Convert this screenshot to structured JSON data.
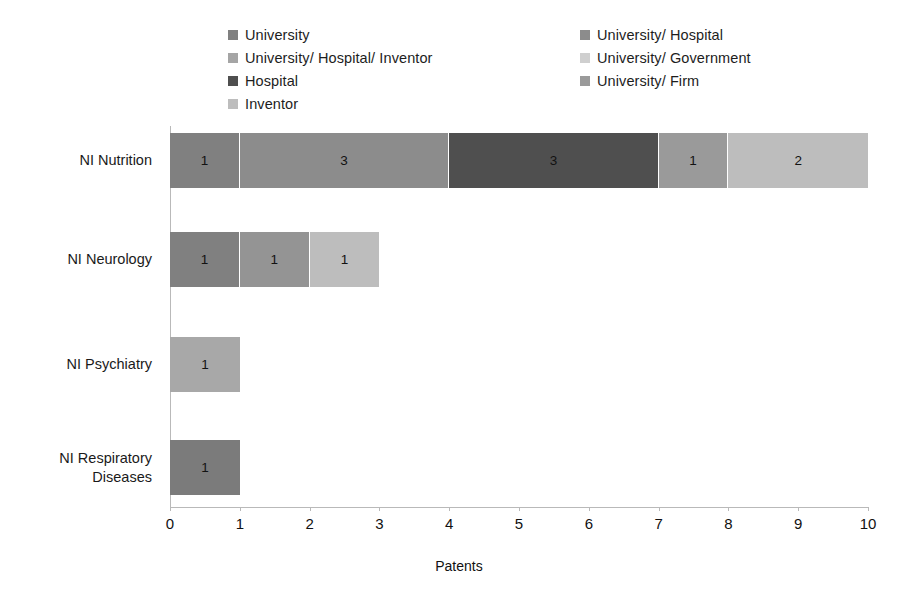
{
  "chart_data": {
    "type": "bar",
    "orientation": "horizontal",
    "stacked": true,
    "title": "",
    "xlabel": "Patents",
    "ylabel": "",
    "xlim": [
      0,
      10
    ],
    "xticks": [
      "0",
      "1",
      "2",
      "3",
      "4",
      "5",
      "6",
      "7",
      "8",
      "9",
      "10"
    ],
    "grid": false,
    "legend_position": "top",
    "categories": [
      "NI Nutrition",
      "NI Neurology",
      "NI Psychiatry",
      "NI Respiratory Diseases"
    ],
    "category_lines": [
      [
        "NI Nutrition"
      ],
      [
        "NI Neurology"
      ],
      [
        "NI Psychiatry"
      ],
      [
        "NI Respiratory",
        "Diseases"
      ]
    ],
    "series": [
      {
        "name": "University",
        "color": "#808080",
        "values": [
          1,
          1,
          0,
          1
        ]
      },
      {
        "name": "University/ Hospital",
        "color": "#8c8c8c",
        "values": [
          3,
          1,
          0,
          0
        ]
      },
      {
        "name": "University/ Hospital/ Inventor",
        "color": "#a5a5a5",
        "values": [
          0,
          0,
          0,
          0
        ]
      },
      {
        "name": "University/ Government",
        "color": "#cfcfcf",
        "values": [
          0,
          0,
          0,
          0
        ]
      },
      {
        "name": "Hospital",
        "color": "#4f4f4f",
        "values": [
          3,
          0,
          0,
          0
        ]
      },
      {
        "name": "University/ Firm",
        "color": "#9a9a9a",
        "values": [
          1,
          0,
          0,
          0
        ]
      },
      {
        "name": "Inventor",
        "color": "#bdbdbd",
        "values": [
          2,
          1,
          1,
          0
        ]
      }
    ],
    "bars": [
      {
        "category": "NI Nutrition",
        "total": 10,
        "segments": [
          {
            "series": "University",
            "value": 1,
            "label": "1",
            "color": "#808080"
          },
          {
            "series": "University/ Hospital",
            "value": 3,
            "label": "3",
            "color": "#8c8c8c"
          },
          {
            "series": "Hospital",
            "value": 3,
            "label": "3",
            "color": "#4f4f4f"
          },
          {
            "series": "University/ Firm",
            "value": 1,
            "label": "1",
            "color": "#9a9a9a"
          },
          {
            "series": "Inventor",
            "value": 2,
            "label": "2",
            "color": "#bdbdbd"
          }
        ]
      },
      {
        "category": "NI Neurology",
        "total": 3,
        "segments": [
          {
            "series": "University",
            "value": 1,
            "label": "1",
            "color": "#808080"
          },
          {
            "series": "University/ Hospital",
            "value": 1,
            "label": "1",
            "color": "#949494"
          },
          {
            "series": "Inventor",
            "value": 1,
            "label": "1",
            "color": "#bdbdbd"
          }
        ]
      },
      {
        "category": "NI Psychiatry",
        "total": 1,
        "segments": [
          {
            "series": "Inventor",
            "value": 1,
            "label": "1",
            "color": "#a8a8a8"
          }
        ]
      },
      {
        "category": "NI Respiratory Diseases",
        "total": 1,
        "segments": [
          {
            "series": "University",
            "value": 1,
            "label": "1",
            "color": "#7b7b7b"
          }
        ]
      }
    ]
  },
  "legend": {
    "left_column": [
      {
        "label": "University",
        "color": "#808080"
      },
      {
        "label": "University/ Hospital/ Inventor",
        "color": "#a5a5a5"
      },
      {
        "label": "Hospital",
        "color": "#4f4f4f"
      },
      {
        "label": "Inventor",
        "color": "#bdbdbd"
      }
    ],
    "right_column": [
      {
        "label": "University/ Hospital",
        "color": "#8c8c8c"
      },
      {
        "label": "University/ Government",
        "color": "#cfcfcf"
      },
      {
        "label": "University/ Firm",
        "color": "#9a9a9a"
      }
    ]
  },
  "axis": {
    "x_title": "Patents",
    "x_ticks": [
      "0",
      "1",
      "2",
      "3",
      "4",
      "5",
      "6",
      "7",
      "8",
      "9",
      "10"
    ]
  }
}
